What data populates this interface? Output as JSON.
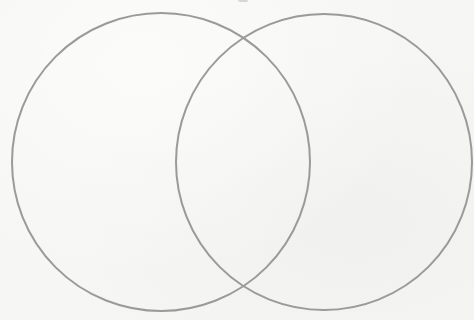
{
  "diagram": {
    "type": "venn",
    "set_count": 2,
    "background_color": "#f6f6f4",
    "stroke_color": "#9a9a9a",
    "stroke_width": 2,
    "sets": [
      {
        "id": "left",
        "label": "",
        "cx": 161,
        "cy": 162,
        "r": 149
      },
      {
        "id": "right",
        "label": "",
        "cx": 324,
        "cy": 162,
        "r": 148
      }
    ],
    "intersection_label": "",
    "labels_visible": false
  }
}
